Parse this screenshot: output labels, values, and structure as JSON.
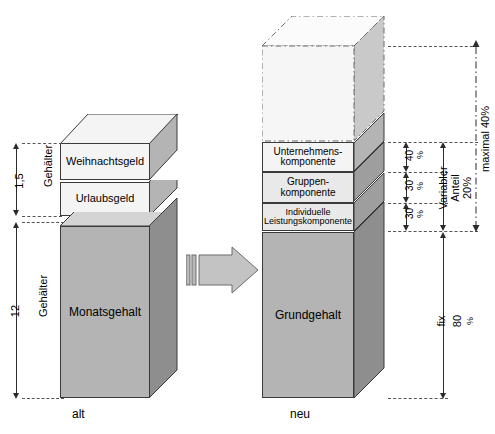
{
  "figure": {
    "title": "",
    "left_column": {
      "caption": "alt",
      "blocks": [
        {
          "label": "Weihnachtsgeld",
          "id": "weihnachtsgeld"
        },
        {
          "label": "Urlaubsgeld",
          "id": "urlaubsgeld"
        },
        {
          "label": "Monatsgehalt",
          "id": "monatsgehalt"
        }
      ],
      "dimensions": [
        {
          "value": "1,5",
          "unit": "Gehälter",
          "id": "sonderzahlungen"
        },
        {
          "value": "12",
          "unit": "Gehälter",
          "id": "monatsgehalt-dim"
        }
      ]
    },
    "right_column": {
      "caption": "neu",
      "blocks": [
        {
          "label": "",
          "id": "potenzial-ghost"
        },
        {
          "label": "Unternehmens-\nkomponente",
          "line1": "Unternehmens-",
          "line2": "komponente",
          "id": "unternehmenskomponente"
        },
        {
          "label": "Gruppen-\nkomponente",
          "line1": "Gruppen-",
          "line2": "komponente",
          "id": "gruppenkomponente"
        },
        {
          "label": "Individuelle\nLeistungskomponente",
          "line1": "Individuelle",
          "line2": "Leistungskomponente",
          "id": "individuelle-leistungskomponente"
        },
        {
          "label": "Grundgehalt",
          "id": "grundgehalt"
        }
      ],
      "dimensions": [
        {
          "value": "40",
          "unit": "%",
          "id": "anteil-unternehmen"
        },
        {
          "value": "30",
          "unit": "%",
          "id": "anteil-gruppe"
        },
        {
          "value": "30",
          "unit": "%",
          "id": "anteil-individuell"
        },
        {
          "label": "Variabler",
          "label2": "Anteil",
          "value": "20%",
          "id": "variabler-anteil"
        },
        {
          "label": "maximal 40%",
          "id": "maximal"
        },
        {
          "label": "fix",
          "value": "80",
          "unit": "%",
          "id": "fix"
        }
      ]
    },
    "transition_arrow": {
      "id": "transition-arrow",
      "direction": "right"
    }
  },
  "colors": {
    "block_front_light": "#e9e9e9",
    "block_front_white": "#f4f4f4",
    "block_front_mid": "#b4b4b4",
    "block_side_dark": "#8e8e8e",
    "line": "#2b2b2b",
    "dash": "#555555"
  }
}
